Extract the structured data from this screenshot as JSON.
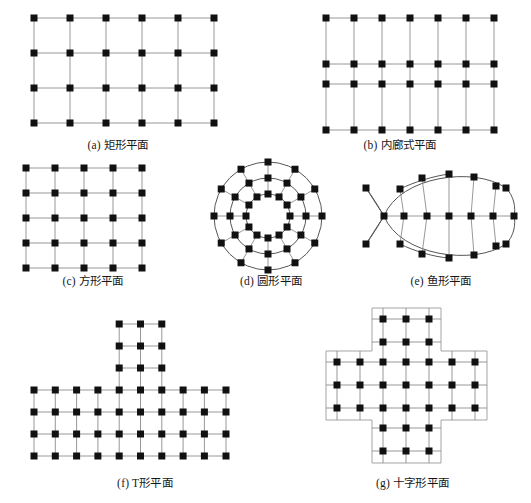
{
  "figure": {
    "background": "#ffffff",
    "node_color": "#111111",
    "line_color": "#8c8c8c",
    "curve_color": "#555555",
    "panels": [
      {
        "id": "a",
        "caption": "(a) 矩形平面",
        "type": "rectangular-grid",
        "columns": 6,
        "rows": 4,
        "col_step": 36,
        "row_step": 35,
        "origin_x": 16,
        "origin_y": 12
      },
      {
        "id": "b",
        "caption": "(b) 内廊式平面",
        "type": "corridor-grid",
        "columns": 7,
        "rows": 4,
        "col_step": 28,
        "row_positions": [
          12,
          58,
          78,
          124
        ],
        "origin_x": 16
      },
      {
        "id": "c",
        "caption": "(c) 方形平面",
        "type": "square-grid",
        "columns": 5,
        "rows": 5,
        "col_step": 29,
        "row_step": 25,
        "origin_x": 18,
        "origin_y": 10
      },
      {
        "id": "d",
        "caption": "(d) 圆形平面",
        "type": "radial-circular",
        "rings": 3,
        "spokes": 12,
        "ring_radii": [
          22,
          38,
          54
        ],
        "center_x": 72,
        "center_y": 62
      },
      {
        "id": "e",
        "caption": "(e) 鱼形平面",
        "type": "fish-plan",
        "spine_nodes": 7,
        "ribs": 5,
        "center_x": 82,
        "center_y": 58
      },
      {
        "id": "f",
        "caption": "(f) T形平面",
        "type": "t-shape-grid",
        "base_columns": 10,
        "base_rows": 4,
        "stem_columns": 3,
        "stem_rows": 3,
        "col_step": 24,
        "row_step": 22
      },
      {
        "id": "g",
        "caption": "(g) 十字形平面",
        "type": "cross-shape-grid",
        "arm_columns": 7,
        "arm_rows": 3,
        "stub_columns": 3,
        "stub_rows": 2,
        "col_step": 23,
        "row_step": 22
      }
    ]
  }
}
